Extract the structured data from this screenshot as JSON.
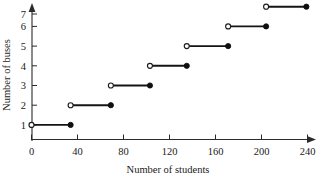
{
  "figure": {
    "width": 320,
    "height": 178,
    "background": "#ffffff",
    "line_color": "#141414",
    "axis_color": "#2b2b2b"
  },
  "chart_data": {
    "type": "line",
    "subtype": "step-function",
    "title": "",
    "xlabel": "Number of students",
    "ylabel": "Number of buses",
    "xlim": [
      0,
      245
    ],
    "ylim": [
      0,
      7.6
    ],
    "grid": false,
    "legend": null,
    "xticks": [
      0,
      40,
      80,
      120,
      160,
      200,
      240
    ],
    "xtick_labels": [
      "0",
      "40",
      "80",
      "120",
      "160",
      "200",
      "240"
    ],
    "yticks": [
      1,
      2,
      3,
      4,
      5,
      6,
      7
    ],
    "ytick_labels": [
      "1",
      "2",
      "3",
      "4",
      "5",
      "6",
      "7"
    ],
    "x_axis_arrow": true,
    "y_axis_arrow": true,
    "segments": [
      {
        "y": 1,
        "x_start": 0,
        "x_end": 34,
        "start_marker": "open",
        "end_marker": "closed"
      },
      {
        "y": 2,
        "x_start": 34,
        "x_end": 69,
        "start_marker": "open",
        "end_marker": "closed"
      },
      {
        "y": 3,
        "x_start": 69,
        "x_end": 103,
        "start_marker": "open",
        "end_marker": "closed"
      },
      {
        "y": 4,
        "x_start": 103,
        "x_end": 135,
        "start_marker": "open",
        "end_marker": "closed"
      },
      {
        "y": 5,
        "x_start": 135,
        "x_end": 171,
        "start_marker": "open",
        "end_marker": "closed"
      },
      {
        "y": 6,
        "x_start": 171,
        "x_end": 204,
        "start_marker": "open",
        "end_marker": "closed"
      },
      {
        "y": 7,
        "x_start": 204,
        "x_end": 239,
        "start_marker": "open",
        "end_marker": "closed"
      }
    ]
  }
}
